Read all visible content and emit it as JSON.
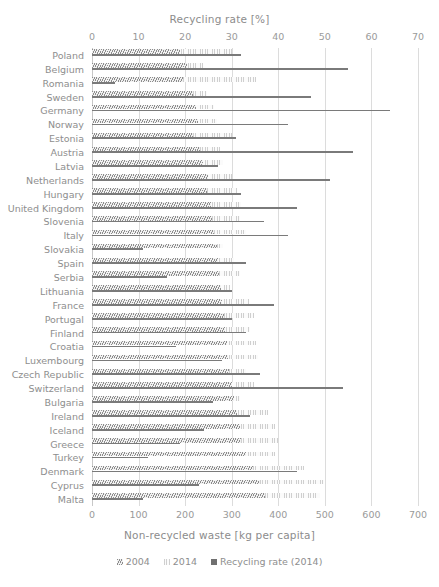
{
  "chart_data": {
    "type": "bar",
    "orientation": "horizontal",
    "title": "",
    "top_axis": {
      "label": "Recycling rate [%]",
      "ticks": [
        0,
        10,
        20,
        30,
        40,
        50,
        60,
        70
      ],
      "lim": [
        0,
        70
      ]
    },
    "bottom_axis": {
      "label": "Non-recycled waste [kg per capita]",
      "ticks": [
        0,
        100,
        200,
        300,
        400,
        500,
        600,
        700
      ],
      "lim": [
        0,
        700
      ]
    },
    "grid": true,
    "legend_position": "bottom",
    "categories": [
      "Poland",
      "Belgium",
      "Romania",
      "Sweden",
      "Germany",
      "Norway",
      "Estonia",
      "Austria",
      "Latvia",
      "Netherlands",
      "Hungary",
      "United Kingdom",
      "Slovenia",
      "Italy",
      "Slovakia",
      "Spain",
      "Serbia",
      "Lithuania",
      "France",
      "Portugal",
      "Finland",
      "Croatia",
      "Luxembourg",
      "Czech Republic",
      "Switzerland",
      "Bulgaria",
      "Ireland",
      "Iceland",
      "Greece",
      "Turkey",
      "Denmark",
      "Cyprus",
      "Malta"
    ],
    "series": [
      {
        "name": "2004",
        "unit": "kg per capita",
        "axis": "bottom",
        "values": [
          190,
          205,
          196,
          216,
          224,
          227,
          216,
          231,
          238,
          250,
          248,
          255,
          258,
          262,
          268,
          270,
          272,
          276,
          280,
          283,
          285,
          290,
          292,
          295,
          300,
          305,
          312,
          318,
          320,
          330,
          345,
          360,
          372
        ]
      },
      {
        "name": "2014",
        "unit": "kg per capita",
        "axis": "bottom",
        "values": [
          300,
          238,
          352,
          248,
          262,
          268,
          300,
          275,
          282,
          300,
          312,
          320,
          318,
          330,
          282,
          305,
          318,
          296,
          338,
          348,
          340,
          352,
          356,
          330,
          348,
          318,
          378,
          392,
          400,
          394,
          456,
          498,
          490
        ]
      },
      {
        "name": "Recycling rate (2014)",
        "unit": "%",
        "axis": "top",
        "values": [
          32,
          55,
          5,
          47,
          64,
          42,
          31,
          56,
          27,
          51,
          32,
          44,
          37,
          42,
          11,
          33,
          16,
          30,
          39,
          30,
          33,
          18,
          28,
          36,
          54,
          26,
          34,
          24,
          19,
          12,
          44,
          23,
          11
        ]
      }
    ]
  },
  "legend": {
    "items": [
      {
        "label": "2004",
        "marker": "hatch-dark-diagonal"
      },
      {
        "label": "2014",
        "marker": "hatch-light-dotted"
      },
      {
        "label": "Recycling rate (2014)",
        "marker": "solid-dark-square"
      }
    ]
  },
  "colors": {
    "series_2004": "#8d8d8d",
    "series_2014": "#cfcfcf",
    "rate_line": "#7a7a7a",
    "gridline": "#dcdcdc",
    "text": "#8e8e8e",
    "background": "#ffffff"
  }
}
